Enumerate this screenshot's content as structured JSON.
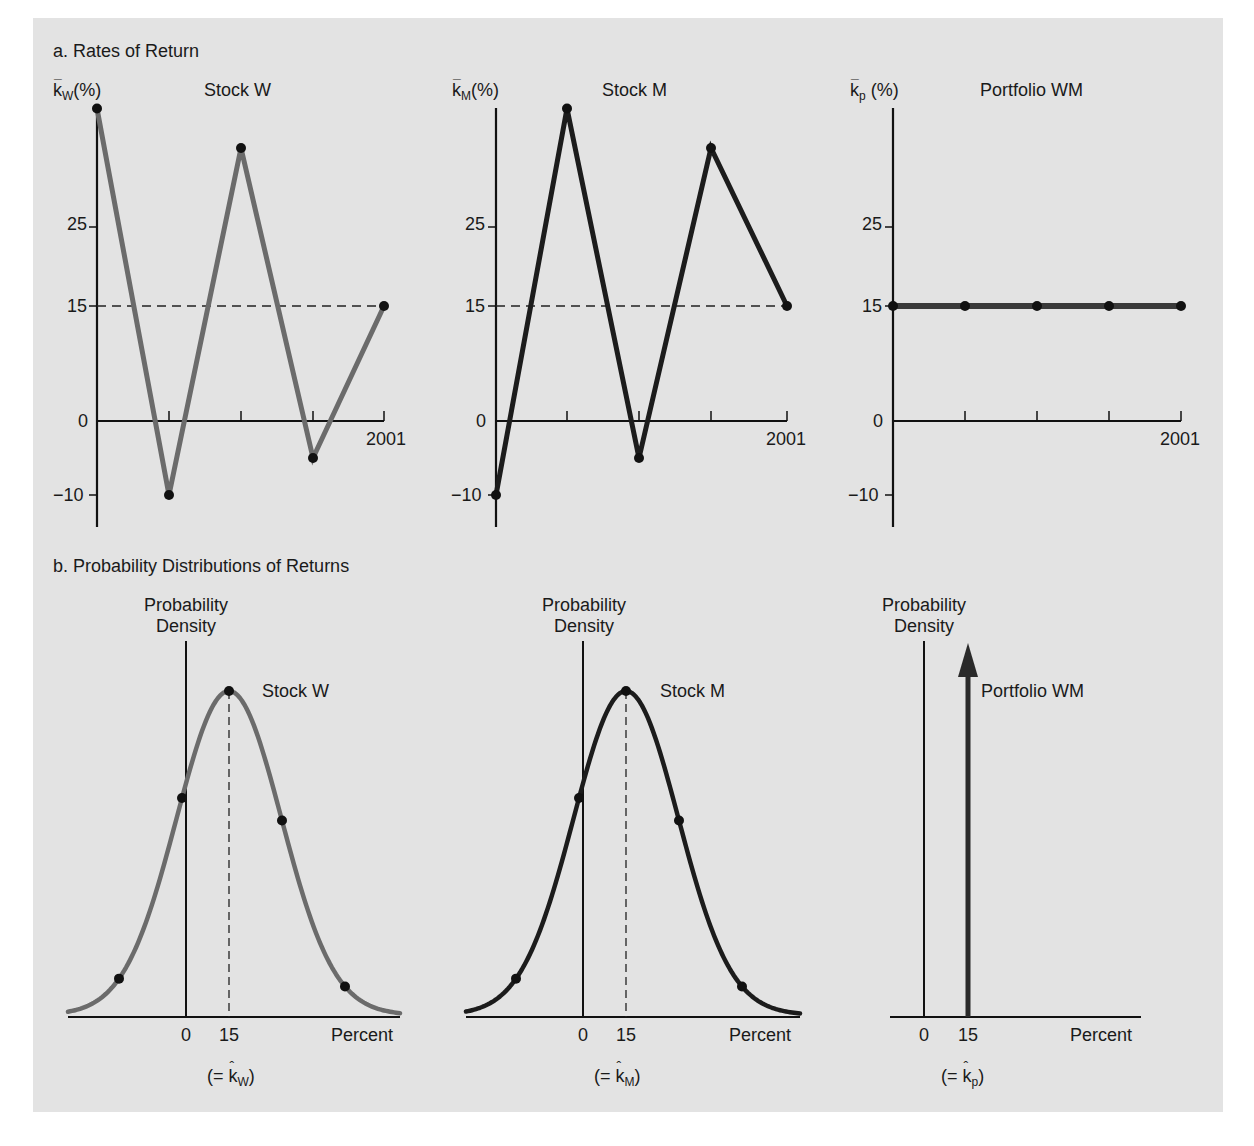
{
  "sections": {
    "a_title": "a. Rates of Return",
    "b_title": "b. Probability Distributions of Returns"
  },
  "colors": {
    "background": "#e3e3e3",
    "stock_w_line": "#6b6b6b",
    "stock_m_line": "#1c1c1c",
    "portfolio_line": "#3a3a3a",
    "axis": "#111111",
    "marker": "#111111"
  },
  "top_charts": [
    {
      "title": "Stock W",
      "ylabel_symbol": "k",
      "ylabel_sub": "W",
      "ylabel_suffix": "(%)",
      "end_year_label": "2001",
      "y_ticks": [
        "25",
        "15",
        "0",
        "−10"
      ]
    },
    {
      "title": "Stock M",
      "ylabel_symbol": "k",
      "ylabel_sub": "M",
      "ylabel_suffix": "(%)",
      "end_year_label": "2001",
      "y_ticks": [
        "25",
        "15",
        "0",
        "−10"
      ]
    },
    {
      "title": "Portfolio WM",
      "ylabel_symbol": "k",
      "ylabel_sub": "p",
      "ylabel_suffix": " (%)",
      "end_year_label": "2001",
      "y_ticks": [
        "25",
        "15",
        "0",
        "−10"
      ]
    }
  ],
  "bottom_charts": [
    {
      "ylabel_line1": "Probability",
      "ylabel_line2": "Density",
      "series_label": "Stock W",
      "x_tick_0": "0",
      "x_tick_15": "15",
      "x_label": "Percent",
      "expected_prefix": "(= ",
      "expected_symbol": "k",
      "expected_sub": "W",
      "expected_suffix": ")"
    },
    {
      "ylabel_line1": "Probability",
      "ylabel_line2": "Density",
      "series_label": "Stock M",
      "x_tick_0": "0",
      "x_tick_15": "15",
      "x_label": "Percent",
      "expected_prefix": "(= ",
      "expected_symbol": "k",
      "expected_sub": "M",
      "expected_suffix": ")"
    },
    {
      "ylabel_line1": "Probability",
      "ylabel_line2": "Density",
      "series_label": "Portfolio WM",
      "x_tick_0": "0",
      "x_tick_15": "15",
      "x_label": "Percent",
      "expected_prefix": "(= ",
      "expected_symbol": "k",
      "expected_sub": "p",
      "expected_suffix": ")"
    }
  ],
  "chart_data": [
    {
      "type": "line",
      "title": "Stock W",
      "section": "a. Rates of Return",
      "xlabel": "",
      "ylabel": "k̄W (%)",
      "x": [
        "1997",
        "1998",
        "1999",
        "2000",
        "2001"
      ],
      "x_tick_labels_visible": [
        "",
        "",
        "",
        "",
        "2001"
      ],
      "values": [
        40,
        -10,
        35,
        -5,
        15
      ],
      "reference_line": {
        "y": 15,
        "style": "dashed"
      },
      "y_ticks": [
        -10,
        0,
        15,
        25
      ],
      "ylim": [
        -14,
        42
      ],
      "grid": false
    },
    {
      "type": "line",
      "title": "Stock M",
      "section": "a. Rates of Return",
      "xlabel": "",
      "ylabel": "k̄M (%)",
      "x": [
        "1997",
        "1998",
        "1999",
        "2000",
        "2001"
      ],
      "x_tick_labels_visible": [
        "",
        "",
        "",
        "",
        "2001"
      ],
      "values": [
        -10,
        40,
        -5,
        35,
        15
      ],
      "reference_line": {
        "y": 15,
        "style": "dashed"
      },
      "y_ticks": [
        -10,
        0,
        15,
        25
      ],
      "ylim": [
        -14,
        42
      ],
      "grid": false
    },
    {
      "type": "line",
      "title": "Portfolio WM",
      "section": "a. Rates of Return",
      "xlabel": "",
      "ylabel": "k̄p (%)",
      "x": [
        "1997",
        "1998",
        "1999",
        "2000",
        "2001"
      ],
      "x_tick_labels_visible": [
        "",
        "",
        "",
        "",
        "2001"
      ],
      "values": [
        15,
        15,
        15,
        15,
        15
      ],
      "y_ticks": [
        -10,
        0,
        15,
        25
      ],
      "ylim": [
        -14,
        42
      ],
      "grid": false
    },
    {
      "type": "area",
      "title": "Stock W",
      "section": "b. Probability Distributions of Returns",
      "xlabel": "Percent",
      "ylabel": "Probability Density",
      "distribution": "normal",
      "mean": 15,
      "x_ticks": [
        0,
        15
      ],
      "marked_points_x": [
        -22,
        -1,
        15,
        32,
        54
      ],
      "annotation": "(= k̂W)"
    },
    {
      "type": "area",
      "title": "Stock M",
      "section": "b. Probability Distributions of Returns",
      "xlabel": "Percent",
      "ylabel": "Probability Density",
      "distribution": "normal",
      "mean": 15,
      "x_ticks": [
        0,
        15
      ],
      "marked_points_x": [
        -22,
        -1,
        15,
        32,
        54
      ],
      "annotation": "(= k̂M)"
    },
    {
      "type": "line",
      "title": "Portfolio WM",
      "section": "b. Probability Distributions of Returns",
      "xlabel": "Percent",
      "ylabel": "Probability Density",
      "distribution": "degenerate (spike at mean, drawn as arrow)",
      "mean": 15,
      "x_ticks": [
        0,
        15
      ],
      "annotation": "(= k̂p)"
    }
  ]
}
